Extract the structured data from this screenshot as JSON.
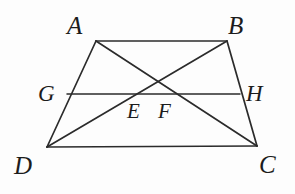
{
  "figure": {
    "name": "trapezoid-with-diagonals-and-midsegment",
    "background_color": "#fdfdfd",
    "stroke_color": "#2b2b2b",
    "label_color": "#1c1c1c",
    "stroke_width": 1.6,
    "width": 295,
    "height": 194
  },
  "labels": {
    "a": "A",
    "b": "B",
    "c": "C",
    "d": "D",
    "e": "E",
    "f": "F",
    "g": "G",
    "h": "H"
  },
  "label_positions": {
    "a": {
      "x": 67,
      "y": 13
    },
    "b": {
      "x": 228,
      "y": 13
    },
    "c": {
      "x": 259,
      "y": 152
    },
    "d": {
      "x": 14,
      "y": 153
    },
    "e": {
      "x": 127,
      "y": 101
    },
    "f": {
      "x": 158,
      "y": 101
    },
    "g": {
      "x": 38,
      "y": 82
    },
    "h": {
      "x": 246,
      "y": 82
    }
  },
  "points": {
    "A": {
      "x": 96,
      "y": 41
    },
    "B": {
      "x": 227,
      "y": 41
    },
    "C": {
      "x": 257,
      "y": 146
    },
    "D": {
      "x": 47,
      "y": 147
    },
    "G": {
      "x": 67,
      "y": 94
    },
    "H": {
      "x": 240,
      "y": 94
    },
    "E": {
      "x": 137,
      "y": 94
    },
    "F": {
      "x": 172,
      "y": 94
    },
    "X": {
      "x": 155,
      "y": 78
    }
  },
  "segments": [
    {
      "name": "side-AB",
      "from": "A",
      "to": "B"
    },
    {
      "name": "side-BC",
      "from": "B",
      "to": "C"
    },
    {
      "name": "side-CD",
      "from": "C",
      "to": "D"
    },
    {
      "name": "side-DA",
      "from": "D",
      "to": "A"
    },
    {
      "name": "diagonal-AC",
      "from": "A",
      "to": "C"
    },
    {
      "name": "diagonal-BD",
      "from": "B",
      "to": "D"
    },
    {
      "name": "midsegment-GH",
      "from": "G",
      "to": "H"
    }
  ]
}
